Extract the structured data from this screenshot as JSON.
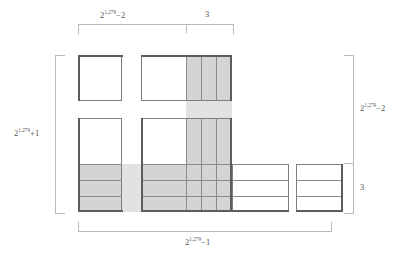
{
  "diagram": {
    "kind": "geometric-dissection",
    "exponent": "1,279",
    "labels": {
      "top_left": {
        "base": "2",
        "exp": "1,279",
        "tail": "−2"
      },
      "top_right": {
        "text": "3"
      },
      "left": {
        "base": "2",
        "exp": "1,279",
        "tail": "+1"
      },
      "right_upper": {
        "base": "2",
        "exp": "1,279",
        "tail": "−2"
      },
      "right_lower": {
        "text": "3"
      },
      "bottom": {
        "base": "2",
        "exp": "1,279",
        "tail": "−1"
      }
    },
    "colors": {
      "shade": "#d4d4d4",
      "shade_light": "#e2e2e2",
      "tile_border": "#7d7d7d",
      "bracket": "#b9b9b9",
      "text": "#555555",
      "background": "#ffffff"
    },
    "counts": {
      "strip_subcolumns": 3,
      "band_rows": 3
    }
  }
}
